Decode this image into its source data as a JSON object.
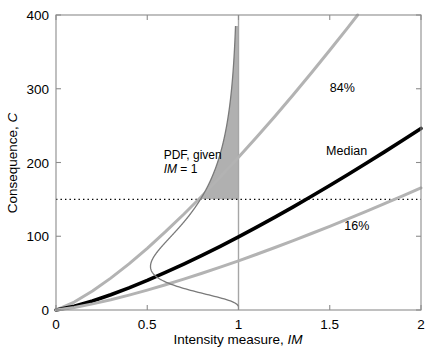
{
  "chart_data": {
    "type": "line",
    "title": "",
    "xlabel": "Intensity measure, IM",
    "xlabel_plain": "Intensity measure, ",
    "xlabel_italic": "IM",
    "ylabel": "Consequence, C",
    "ylabel_plain": "Consequence, ",
    "ylabel_italic": "C",
    "xlim": [
      0,
      2
    ],
    "ylim": [
      0,
      400
    ],
    "xticks": [
      "0",
      "0.5",
      "1",
      "1.5",
      "2"
    ],
    "xtick_values": [
      0,
      0.5,
      1,
      1.5,
      2
    ],
    "yticks": [
      "0",
      "100",
      "200",
      "300",
      "400"
    ],
    "ytick_values": [
      0,
      100,
      200,
      300,
      400
    ],
    "grid": false,
    "legend_position": "inline-annotations",
    "series": [
      {
        "name": "84%",
        "label": "84%",
        "color": "#b3b3b3",
        "width": 3.0,
        "x": [
          0,
          0.1,
          0.2,
          0.3,
          0.4,
          0.5,
          0.6,
          0.7,
          0.8,
          0.9,
          1.0,
          1.1,
          1.2,
          1.3,
          1.4,
          1.5,
          1.6,
          1.7,
          1.8,
          1.9,
          2.0
        ],
        "values": [
          0,
          10.8,
          25.7,
          43.2,
          62.6,
          83.7,
          106.2,
          129.8,
          154.6,
          180.3,
          207.0,
          234.5,
          262.8,
          291.9,
          321.7,
          352.2,
          383.3,
          415.0,
          447.3,
          480.2,
          513.6
        ]
      },
      {
        "name": "Median",
        "label": "Median",
        "color": "#000000",
        "width": 3.6,
        "x": [
          0,
          0.1,
          0.2,
          0.3,
          0.4,
          0.5,
          0.6,
          0.7,
          0.8,
          0.9,
          1.0,
          1.1,
          1.2,
          1.3,
          1.4,
          1.5,
          1.6,
          1.7,
          1.8,
          1.9,
          2.0
        ],
        "values": [
          0,
          5.2,
          12.3,
          20.7,
          30.0,
          40.1,
          50.9,
          62.2,
          74.1,
          86.4,
          99.2,
          112.4,
          126.0,
          139.9,
          154.2,
          168.8,
          183.7,
          198.9,
          214.4,
          230.2,
          246.2
        ]
      },
      {
        "name": "16%",
        "label": "16%",
        "color": "#b3b3b3",
        "width": 3.0,
        "x": [
          0,
          0.1,
          0.2,
          0.3,
          0.4,
          0.5,
          0.6,
          0.7,
          0.8,
          0.9,
          1.0,
          1.1,
          1.2,
          1.3,
          1.4,
          1.5,
          1.6,
          1.7,
          1.8,
          1.9,
          2.0
        ],
        "values": [
          0,
          3.5,
          8.3,
          13.9,
          20.2,
          27.0,
          34.2,
          41.8,
          49.8,
          58.1,
          66.7,
          75.6,
          84.7,
          94.1,
          103.7,
          113.5,
          123.5,
          133.7,
          144.2,
          154.8,
          165.5
        ]
      }
    ],
    "annotations": [
      {
        "name": "pdf-annotation",
        "line1": "PDF, given",
        "line2_plain": "IM",
        "line2_rest": " = 1",
        "x": 0.59,
        "y": 205
      },
      {
        "name": "label-84",
        "text": "84%",
        "x": 1.5,
        "y": 295
      },
      {
        "name": "label-median",
        "text": "Median",
        "x": 1.48,
        "y": 210
      },
      {
        "name": "label-16",
        "text": "16%",
        "x": 1.58,
        "y": 108
      }
    ],
    "pdf": {
      "description": "Rotated lognormal probability density of C given IM = 1, drawn horizontally at IM = 1",
      "at_im": 1.0,
      "median": 99.2,
      "beta": 0.72,
      "curve_color": "#7a7a7a",
      "shade_color": "#b0b0b0",
      "shade_from": 150,
      "shade_to": 400,
      "c_min": 5,
      "c_max": 385
    },
    "reference_lines": [
      {
        "name": "consequence-threshold",
        "orientation": "horizontal",
        "value": 150,
        "style": "dotted",
        "color": "#000000"
      },
      {
        "name": "im-level",
        "orientation": "vertical",
        "value": 1,
        "style": "solid",
        "color": "#a6a6a6"
      }
    ]
  }
}
